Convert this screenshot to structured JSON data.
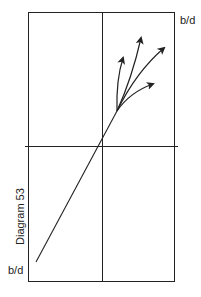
{
  "diagram": {
    "caption": "Diagram 53",
    "labels": {
      "top_right": "b/d",
      "bottom_left": "b/d"
    },
    "colors": {
      "line": "#222222",
      "background": "#ffffff"
    },
    "geometry": {
      "frame": {
        "left": 28,
        "top": 12,
        "right": 174,
        "bottom": 281
      },
      "middle_vertical_x": 102,
      "horizontal_axis": {
        "y": 146,
        "x1": 25,
        "x2": 178
      },
      "main_line": {
        "from": [
          36,
          262
        ],
        "to": [
          117,
          111
        ]
      },
      "arrows": [
        {
          "tip": [
            123,
            58
          ]
        },
        {
          "tip": [
            141,
            38
          ]
        },
        {
          "tip": [
            164,
            48
          ]
        },
        {
          "tip": [
            153,
            84
          ]
        }
      ]
    }
  }
}
